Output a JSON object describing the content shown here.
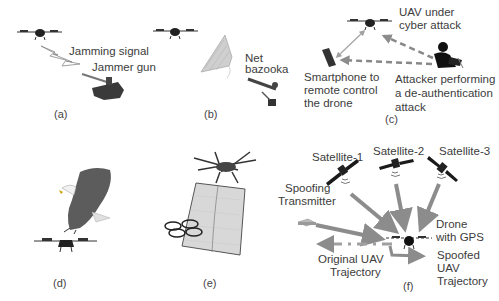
{
  "panels": {
    "a": {
      "caption": "(a)",
      "labels": {
        "jamming_signal": "Jamming signal",
        "jammer_gun": "Jammer gun"
      }
    },
    "b": {
      "caption": "(b)",
      "labels": {
        "net_bazooka_1": "Net",
        "net_bazooka_2": "bazooka"
      }
    },
    "c": {
      "caption": "(c)",
      "labels": {
        "uav_1": "UAV under",
        "uav_2": "cyber attack",
        "phone_1": "Smartphone to",
        "phone_2": "remote control",
        "phone_3": "the drone",
        "attacker_1": "Attacker performing",
        "attacker_2": "a de-authentication",
        "attacker_3": "attack"
      }
    },
    "d": {
      "caption": "(d)"
    },
    "e": {
      "caption": "(e)"
    },
    "f": {
      "caption": "(f)",
      "labels": {
        "sat1": "Satellite-1",
        "sat2": "Satellite-2",
        "sat3": "Satellite-3",
        "spoof_1": "Spoofing",
        "spoof_2": "Transmitter",
        "drone_1": "Drone",
        "drone_2": "with GPS",
        "orig_1": "Original UAV",
        "orig_2": "Trajectory",
        "spoofed_1": "Spoofed",
        "spoofed_2": "UAV",
        "spoofed_3": "Trajectory"
      }
    }
  },
  "colors": {
    "arrow": "#8c8c8c",
    "dark": "#1e1e1e",
    "text": "#3c3c3c"
  }
}
